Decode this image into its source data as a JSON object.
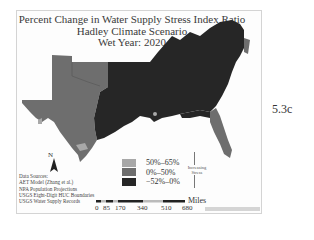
{
  "map": {
    "title_lines": [
      "Percent Change in Water Supply Stress Index Ratio",
      "Hadley Climate Scenario",
      "Wet Year: 2020"
    ],
    "figure_label": "5.3c",
    "legend": [
      {
        "label": "50%–65%",
        "color": "#a8a8a8"
      },
      {
        "label": "0%–50%",
        "color": "#6e6e6e"
      },
      {
        "label": "−52%–0%",
        "color": "#262626"
      }
    ],
    "stress_arrow": {
      "line1": "Increasing",
      "line2": "Stress"
    },
    "north_label": "N",
    "data_sources": [
      "Data Sources:",
      "AET Model (Zhang et al.)",
      "NPA Population Projections",
      "USGS Eight-Digit HUC Boundaries",
      "USGS Water Supply Records"
    ],
    "scale": {
      "unit": "Miles",
      "ticks": [
        "0",
        "85",
        "170",
        "340",
        "510",
        "680"
      ]
    },
    "colors": {
      "dark": "#262626",
      "mid": "#6e6e6e",
      "light": "#a8a8a8"
    }
  }
}
